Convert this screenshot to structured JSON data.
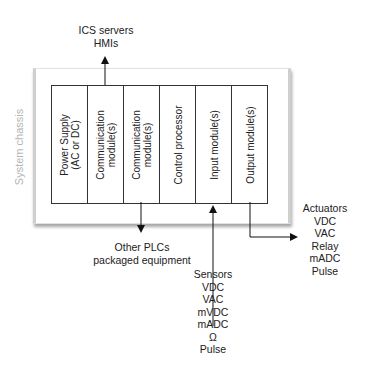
{
  "chassis": {
    "label": "System chassis"
  },
  "modules": [
    {
      "label": "Power Supply\n(AC or DC)"
    },
    {
      "label": "Communication\nmodule(s)"
    },
    {
      "label": "Communication\nmodule(s)"
    },
    {
      "label": "Control processor"
    },
    {
      "label": "Input module(s)"
    },
    {
      "label": "Output module(s)"
    }
  ],
  "connections": {
    "top": {
      "lines": [
        "ICS servers",
        "HMIs"
      ]
    },
    "comm_bottom": {
      "lines": [
        "Other PLCs",
        "packaged equipment"
      ]
    },
    "sensors": {
      "lines": [
        "Sensors",
        "VDC",
        "VAC",
        "mVDC",
        "mADC",
        "Ω",
        "Pulse"
      ]
    },
    "actuators": {
      "lines": [
        "Actuators",
        "VDC",
        "VAC",
        "Relay",
        "mADC",
        "Pulse"
      ]
    }
  }
}
